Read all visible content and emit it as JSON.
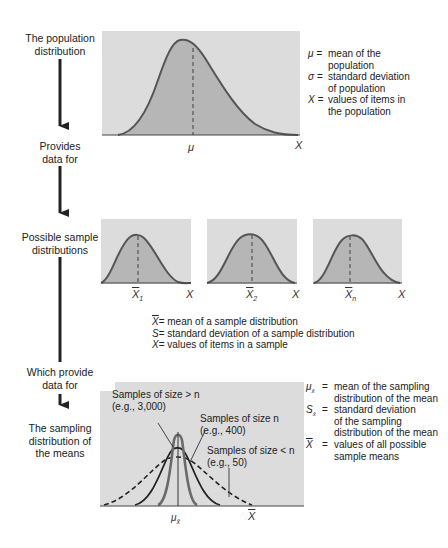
{
  "steps": {
    "population": {
      "line1": "The population",
      "line2": "distribution"
    },
    "provides": {
      "line1": "Provides",
      "line2": "data for"
    },
    "samples": {
      "line1": "Possible sample",
      "line2": "distributions"
    },
    "which_provide": {
      "line1": "Which provide",
      "line2": "data for"
    },
    "sampling": {
      "line1": "The sampling",
      "line2": "distribution of",
      "line3": "the means"
    }
  },
  "population_chart": {
    "mean_label": "μ",
    "axis_label": "X"
  },
  "population_legend": [
    {
      "symbol": "μ =",
      "lines": [
        "mean of the",
        "population"
      ]
    },
    {
      "symbol": "σ =",
      "lines": [
        "standard deviation",
        "of population"
      ]
    },
    {
      "symbol": "X =",
      "lines": [
        "values of items in",
        "the population"
      ]
    }
  ],
  "sample_charts": [
    {
      "mean_symbol": "X",
      "mean_sub": "1",
      "axis_label": "X"
    },
    {
      "mean_symbol": "X",
      "mean_sub": "2",
      "axis_label": "X"
    },
    {
      "mean_symbol": "X",
      "mean_sub": "n",
      "axis_label": "X"
    }
  ],
  "sample_legend": [
    {
      "symbol": "X",
      "text": "= mean of a sample distribution"
    },
    {
      "symbol": "S",
      "text": "= standard deviation of a sample distribution"
    },
    {
      "symbol": "X",
      "text": "= values of items in a sample"
    }
  ],
  "sampling_chart": {
    "mean_label": "μ",
    "mean_sub": "x̄",
    "axis_label": "X",
    "annotations": [
      {
        "line1": "Samples of size > n",
        "line2": "(e.g., 3,000)"
      },
      {
        "line1": "Samples of size n",
        "line2": "(e.g., 400)"
      },
      {
        "line1": "Samples of size < n",
        "line2": "(e.g., 50)"
      }
    ]
  },
  "sampling_legend": [
    {
      "symbol": "μ",
      "sub": "x̄",
      "eq": "=",
      "lines": [
        "mean of the sampling",
        "distribution of the mean"
      ]
    },
    {
      "symbol": "S",
      "sub": "x̄",
      "eq": "=",
      "lines": [
        "standard deviation",
        "of the sampling",
        "distribution of the mean"
      ]
    },
    {
      "symbol": "X",
      "sub": "",
      "eq": "=",
      "lines": [
        "values of all possible",
        "sample means"
      ]
    }
  ],
  "colors": {
    "box_bg": "#dcdcdc",
    "curve_fill": "#b8b8b8",
    "curve_stroke": "#5a5a5a",
    "dark_curve": "#222222",
    "axis": "#444444"
  }
}
